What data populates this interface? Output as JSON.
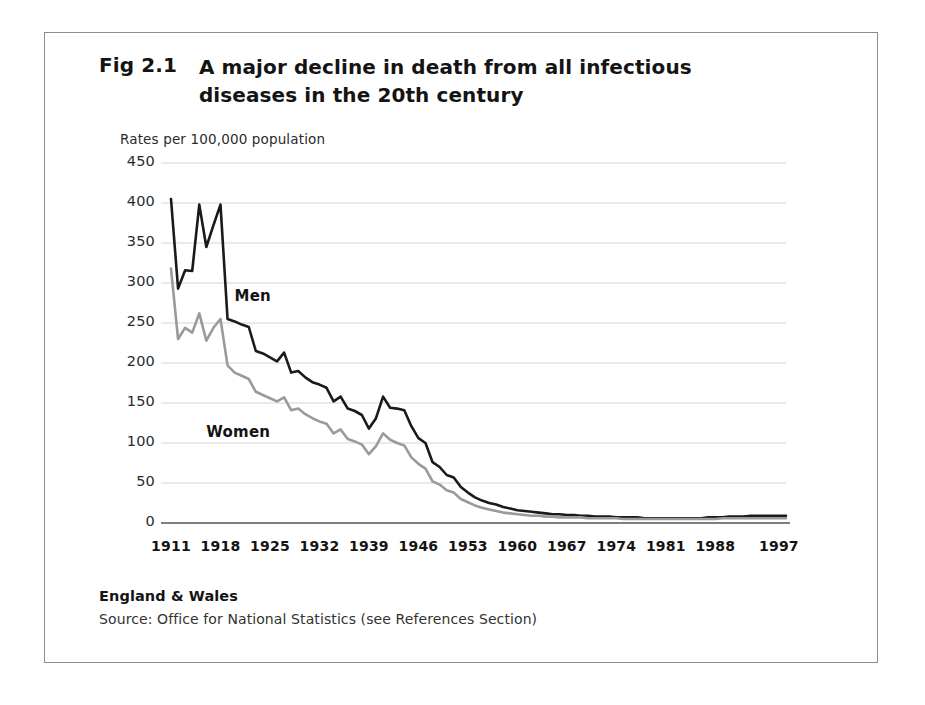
{
  "figure": {
    "number": "Fig 2.1",
    "title": "A major decline in death from all infectious diseases in the 20th century",
    "region": "England & Wales",
    "source": "Source: Office for National Statistics (see References Section)"
  },
  "colors": {
    "men_line": "#1a1a1a",
    "women_line": "#9a9a9a",
    "gridline": "#cfcfcf",
    "axis": "#555555",
    "frame": "#8d8d8d",
    "text": "#141414",
    "background": "#ffffff"
  },
  "chart_data": {
    "type": "line",
    "title": "A major decline in death from all infectious diseases in the 20th century",
    "xlabel": "",
    "ylabel": "Rates per 100,000 population",
    "ylim": [
      0,
      450
    ],
    "xlim": [
      1911,
      1998
    ],
    "grid": true,
    "legend": "inline-annotations",
    "yticks": [
      0,
      50,
      100,
      150,
      200,
      250,
      300,
      350,
      400,
      450
    ],
    "xticks": [
      1911,
      1918,
      1925,
      1932,
      1939,
      1946,
      1953,
      1960,
      1967,
      1974,
      1981,
      1988,
      1997
    ],
    "x": [
      1911,
      1912,
      1913,
      1914,
      1915,
      1916,
      1917,
      1918,
      1919,
      1920,
      1921,
      1922,
      1923,
      1924,
      1925,
      1926,
      1927,
      1928,
      1929,
      1930,
      1931,
      1932,
      1933,
      1934,
      1935,
      1936,
      1937,
      1938,
      1939,
      1940,
      1941,
      1942,
      1943,
      1944,
      1945,
      1946,
      1947,
      1948,
      1949,
      1950,
      1951,
      1952,
      1953,
      1954,
      1955,
      1956,
      1957,
      1958,
      1959,
      1960,
      1961,
      1962,
      1963,
      1964,
      1965,
      1966,
      1967,
      1968,
      1969,
      1970,
      1971,
      1972,
      1973,
      1974,
      1975,
      1976,
      1977,
      1978,
      1979,
      1980,
      1981,
      1982,
      1983,
      1984,
      1985,
      1986,
      1987,
      1988,
      1989,
      1990,
      1991,
      1992,
      1993,
      1994,
      1995,
      1996,
      1997,
      1998
    ],
    "series": [
      {
        "name": "Men",
        "color": "#1a1a1a",
        "values": [
          405,
          293,
          316,
          315,
          398,
          345,
          372,
          398,
          255,
          252,
          248,
          245,
          215,
          212,
          207,
          202,
          213,
          188,
          190,
          182,
          176,
          173,
          169,
          152,
          158,
          143,
          140,
          135,
          118,
          131,
          158,
          144,
          143,
          141,
          121,
          106,
          100,
          76,
          70,
          60,
          57,
          45,
          38,
          32,
          28,
          25,
          23,
          20,
          18,
          16,
          15,
          14,
          13,
          12,
          11,
          11,
          10,
          10,
          9,
          9,
          8,
          8,
          8,
          7,
          7,
          7,
          7,
          6,
          6,
          6,
          6,
          6,
          6,
          6,
          6,
          6,
          7,
          7,
          7,
          8,
          8,
          8,
          9,
          9,
          9,
          9,
          9,
          9
        ]
      },
      {
        "name": "Women",
        "color": "#9a9a9a",
        "values": [
          318,
          230,
          244,
          238,
          262,
          228,
          244,
          255,
          197,
          188,
          184,
          180,
          164,
          160,
          156,
          152,
          157,
          141,
          143,
          136,
          131,
          127,
          124,
          112,
          117,
          105,
          102,
          98,
          86,
          96,
          112,
          104,
          100,
          97,
          82,
          74,
          68,
          52,
          48,
          41,
          38,
          30,
          26,
          22,
          19,
          17,
          15,
          13,
          12,
          11,
          10,
          9,
          9,
          8,
          8,
          7,
          7,
          7,
          7,
          6,
          6,
          6,
          6,
          6,
          5,
          5,
          5,
          5,
          5,
          5,
          5,
          5,
          5,
          5,
          5,
          5,
          5,
          5,
          6,
          6,
          6,
          6,
          6,
          6,
          6,
          6,
          6,
          6
        ]
      }
    ],
    "annotations": [
      {
        "text": "Men",
        "x": 1920,
        "y": 283
      },
      {
        "text": "Women",
        "x": 1916,
        "y": 112
      }
    ]
  }
}
